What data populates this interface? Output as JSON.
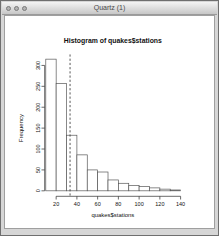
{
  "window": {
    "title": "Quartz (1)",
    "controls": {
      "close": "close-button",
      "minimize": "minimize-button",
      "zoom": "zoom-button"
    }
  },
  "chart_data": {
    "type": "bar",
    "subtype": "histogram",
    "title": "Histogram of quakes$stations",
    "xlabel": "quakes$stations",
    "ylabel": "Frequency",
    "bin_start": 10,
    "bin_width": 10,
    "categories": [
      "10-20",
      "20-30",
      "30-40",
      "40-50",
      "50-60",
      "60-70",
      "70-80",
      "80-90",
      "90-100",
      "100-110",
      "110-120",
      "120-130",
      "130-140"
    ],
    "counts": [
      315,
      257,
      133,
      86,
      50,
      45,
      26,
      18,
      13,
      10,
      7,
      4,
      2
    ],
    "xticks": [
      20,
      40,
      60,
      80,
      100,
      120,
      140
    ],
    "yticks": [
      0,
      50,
      100,
      150,
      200,
      250,
      300
    ],
    "xlim": [
      10,
      140
    ],
    "ylim": [
      0,
      317
    ],
    "grid": "off",
    "legend": "none",
    "mean_line": {
      "x": 33.4,
      "style": "dashed"
    },
    "colors": {
      "bar_fill": "#ffffff",
      "bar_stroke": "#555555",
      "axis": "#333333",
      "mean_line": "#333333",
      "text": "#111111"
    }
  }
}
